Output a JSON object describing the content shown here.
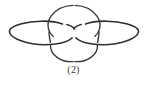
{
  "figure": {
    "name": "link-diagram",
    "caption": "(2)",
    "alt_description": "Three-component link diagram: two horizontal ellipses and a vertical circle",
    "background_color": "#ffffff",
    "stroke_color": "#2e2e34"
  },
  "diagram_data": {
    "type": "knot-link-diagram",
    "component_count": 3,
    "crossing_count": 8,
    "components": [
      {
        "name": "left-ellipse",
        "shape": "ellipse",
        "center": [
          44,
          33
        ],
        "radius_x": 35,
        "radius_y": 12
      },
      {
        "name": "right-ellipse",
        "shape": "ellipse",
        "center": [
          104,
          33
        ],
        "radius_x": 35,
        "radius_y": 12
      },
      {
        "name": "center-circle",
        "shape": "circle",
        "center": [
          74,
          33
        ],
        "radius_x": 28,
        "radius_y": 28
      }
    ]
  }
}
